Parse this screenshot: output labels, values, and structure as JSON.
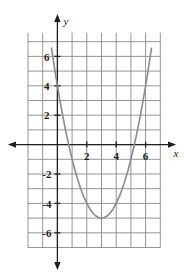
{
  "figure": {
    "name": "coordinate-plane-parabola",
    "background_color": "#ffffff",
    "grid_color": "#7c7c7c",
    "axis_color": "#231f20",
    "curve_color": "#8c8c8c"
  },
  "axes": {
    "x_axis_label": "x",
    "y_axis_label": "y",
    "x_ticks": [
      {
        "value": 2,
        "label": "2"
      },
      {
        "value": 4,
        "label": "4"
      },
      {
        "value": 6,
        "label": "6"
      }
    ],
    "y_ticks": [
      {
        "value": 6,
        "label": "6"
      },
      {
        "value": 4,
        "label": "4"
      },
      {
        "value": 2,
        "label": "2"
      },
      {
        "value": -2,
        "label": "-2"
      },
      {
        "value": -4,
        "label": "-4"
      },
      {
        "value": -6,
        "label": "-6"
      }
    ],
    "xlim": [
      -2,
      7
    ],
    "ylim": [
      -7,
      7
    ],
    "grid": true,
    "arrows": [
      "left",
      "right",
      "up",
      "down"
    ]
  },
  "chart_data": {
    "type": "line",
    "title": "",
    "xlabel": "x",
    "ylabel": "y",
    "xlim": [
      -2,
      7
    ],
    "ylim": [
      -7,
      7
    ],
    "grid": true,
    "legend": "none",
    "series": [
      {
        "name": "parabola",
        "equation": "y = x^2 - 6x + 4",
        "vertex": [
          3,
          -5
        ],
        "x_intercepts": [
          0.76,
          5.24
        ],
        "y_intercept": 4,
        "color": "#8c8c8c",
        "x": [
          -0.6,
          -0.4,
          -0.2,
          0,
          0.2,
          0.4,
          0.6,
          0.8,
          1,
          1.2,
          1.4,
          1.6,
          1.8,
          2,
          2.2,
          2.4,
          2.6,
          2.8,
          3,
          3.2,
          3.4,
          3.6,
          3.8,
          4,
          4.2,
          4.4,
          4.6,
          4.8,
          5,
          5.2,
          5.4,
          5.6,
          5.8,
          6,
          6.2,
          6.4,
          6.6
        ],
        "y": [
          7.96,
          6.56,
          5.24,
          4,
          2.84,
          1.76,
          0.76,
          -0.16,
          -1,
          -1.76,
          -2.44,
          -3.04,
          -3.56,
          -4,
          -4.36,
          -4.64,
          -4.84,
          -4.96,
          -5,
          -4.96,
          -4.84,
          -4.64,
          -4.36,
          -4,
          -3.56,
          -3.04,
          -2.44,
          -1.76,
          -1,
          -0.16,
          0.76,
          1.76,
          2.84,
          4,
          5.24,
          6.56,
          7.96
        ]
      }
    ]
  }
}
